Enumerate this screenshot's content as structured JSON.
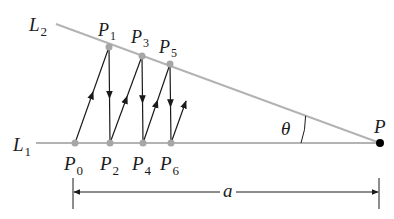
{
  "diagram": {
    "lines": {
      "L1": {
        "label": "L",
        "sub": "1"
      },
      "L2": {
        "label": "L",
        "sub": "2"
      }
    },
    "vertex": {
      "label": "P"
    },
    "angle": {
      "label": "θ"
    },
    "distance": {
      "label": "a"
    },
    "points_on_L1": [
      {
        "label": "P",
        "sub": "0"
      },
      {
        "label": "P",
        "sub": "2"
      },
      {
        "label": "P",
        "sub": "4"
      },
      {
        "label": "P",
        "sub": "6"
      }
    ],
    "points_on_L2": [
      {
        "label": "P",
        "sub": "1"
      },
      {
        "label": "P",
        "sub": "3"
      },
      {
        "label": "P",
        "sub": "5"
      }
    ],
    "colors": {
      "line": "#b3b3b3",
      "point": "#a6a6a6",
      "arrow": "#1a1a1a",
      "vertex": "#000000"
    }
  }
}
